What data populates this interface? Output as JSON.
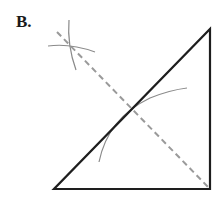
{
  "figure": {
    "label": "B.",
    "colors": {
      "triangle": "#1e1e1e",
      "dashed_line": "#9a9a9a",
      "arcs": "#8a8a8a"
    },
    "triangle": {
      "vertices": [
        [
          54,
          189
        ],
        [
          210,
          189
        ],
        [
          210,
          29
        ]
      ]
    },
    "dashed_line": {
      "from": [
        57,
        32
      ],
      "to": [
        210,
        189
      ]
    },
    "construction_arcs": [
      {
        "name": "top-vertical-arc"
      },
      {
        "name": "top-horizontal-arc"
      },
      {
        "name": "hypotenuse-arc"
      }
    ]
  }
}
